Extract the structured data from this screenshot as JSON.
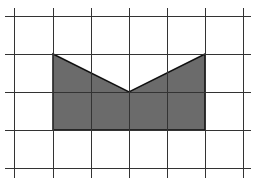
{
  "diagram": {
    "type": "grid-shape",
    "background": "#ffffff",
    "grid": {
      "color": "#333333",
      "line_width": 1,
      "vertical_x": [
        14,
        53,
        91,
        129,
        167,
        205,
        243
      ],
      "horizontal_y": [
        16,
        54,
        92,
        130,
        168
      ],
      "x_extent": [
        5,
        251
      ],
      "y_extent": [
        8,
        178
      ]
    },
    "shape": {
      "fill": "#6b6b6b",
      "stroke": "#111111",
      "stroke_width": 1.5,
      "vertices_grid_units": [
        [
          1,
          1
        ],
        [
          3,
          2
        ],
        [
          5,
          1
        ],
        [
          5,
          3
        ],
        [
          1,
          3
        ]
      ],
      "vertices_px": [
        [
          53,
          54
        ],
        [
          129,
          92
        ],
        [
          205,
          54
        ],
        [
          205,
          130
        ],
        [
          53,
          130
        ]
      ]
    }
  }
}
